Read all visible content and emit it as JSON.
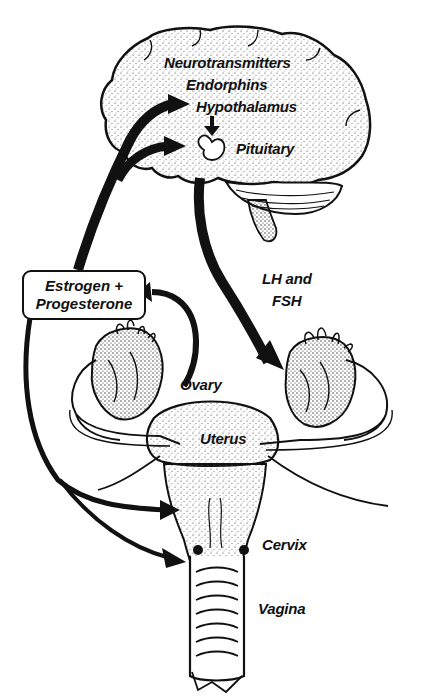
{
  "diagram": {
    "labels": {
      "neurotransmitters": "Neurotransmitters",
      "endorphins": "Endorphins",
      "hypothalamus": "Hypothalamus",
      "pituitary": "Pituitary",
      "lh_fsh_line1": "LH and",
      "lh_fsh_line2": "FSH",
      "hormone_box_line1": "Estrogen +",
      "hormone_box_line2": "Progesterone",
      "ovary": "Ovary",
      "uterus": "Uterus",
      "cervix": "Cervix",
      "vagina": "Vagina"
    },
    "arrows": [
      {
        "from": "Hypothalamus",
        "to": "Pituitary"
      },
      {
        "from": "Pituitary",
        "to": "Ovary",
        "label": "LH and FSH"
      },
      {
        "from": "Ovary",
        "to": "Estrogen + Progesterone"
      },
      {
        "from": "Estrogen + Progesterone",
        "to": "Hypothalamus"
      },
      {
        "from": "Estrogen + Progesterone",
        "to": "Pituitary"
      },
      {
        "from": "Estrogen + Progesterone",
        "to": "Uterus"
      },
      {
        "from": "Estrogen + Progesterone",
        "to": "Vagina"
      }
    ],
    "colors": {
      "ink": "#111111",
      "background": "#ffffff"
    }
  }
}
